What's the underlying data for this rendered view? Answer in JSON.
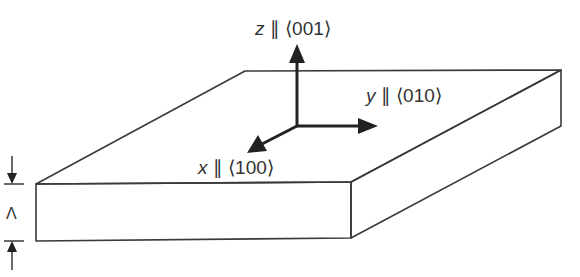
{
  "diagram": {
    "type": "crystal-slab-orientation",
    "slab": {
      "description": "thin rectangular slab in oblique projection",
      "color": "#3a3a3a"
    },
    "axes": [
      {
        "id": "z",
        "variable": "z",
        "relation": "∥",
        "direction": "⟨001⟩"
      },
      {
        "id": "y",
        "variable": "y",
        "relation": "∥",
        "direction": "⟨010⟩"
      },
      {
        "id": "x",
        "variable": "x",
        "relation": "∥",
        "direction": "⟨100⟩"
      }
    ],
    "thickness": {
      "symbol": "Λ"
    }
  }
}
